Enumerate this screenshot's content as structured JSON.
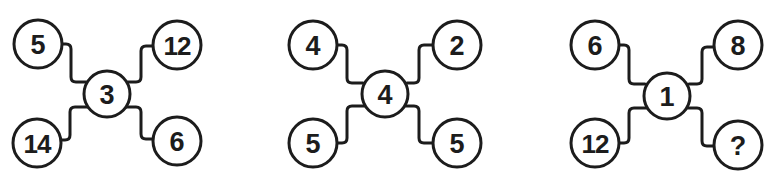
{
  "puzzle": {
    "diagrams": [
      {
        "id": "diagram-1",
        "center": "3",
        "top_left": "5",
        "top_right": "12",
        "bottom_left": "14",
        "bottom_right": "6"
      },
      {
        "id": "diagram-2",
        "center": "4",
        "top_left": "4",
        "top_right": "2",
        "bottom_left": "5",
        "bottom_right": "5"
      },
      {
        "id": "diagram-3",
        "center": "1",
        "top_left": "6",
        "top_right": "8",
        "bottom_left": "12",
        "bottom_right": "?"
      }
    ]
  },
  "colors": {
    "stroke": "#1c1c1c",
    "background": "#ffffff"
  }
}
